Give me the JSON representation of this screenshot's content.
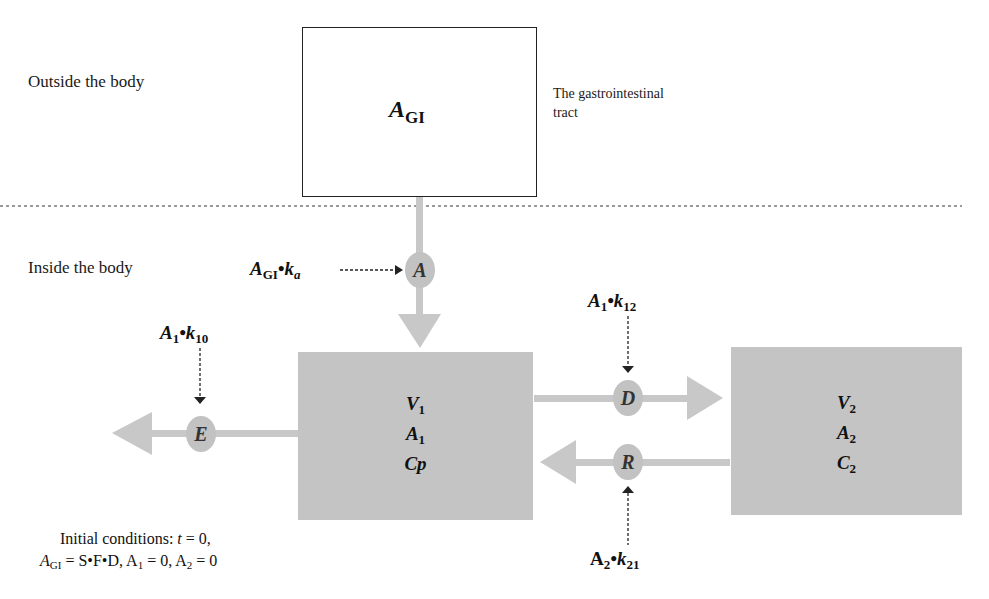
{
  "regions": {
    "outside_label": "Outside the body",
    "inside_label": "Inside the body"
  },
  "gi_compartment": {
    "symbol": "A",
    "symbol_sub": "GI",
    "description_line1": "The gastrointestinal",
    "description_line2": "tract"
  },
  "central_compartment": {
    "line1": "V",
    "line1_sub": "1",
    "line2": "A",
    "line2_sub": "1",
    "line3": "Cp"
  },
  "peripheral_compartment": {
    "line1": "V",
    "line1_sub": "2",
    "line2": "A",
    "line2_sub": "2",
    "line3": "C",
    "line3_sub": "2"
  },
  "processes": {
    "absorption": {
      "node": "A",
      "rate_main": "A",
      "rate_sub1": "GI",
      "rate_mid": "•k",
      "rate_sub2": "a"
    },
    "elimination": {
      "node": "E",
      "rate_main": "A",
      "rate_sub1": "1",
      "rate_mid": "•k",
      "rate_sub2": "10"
    },
    "distribution": {
      "node": "D",
      "rate_main": "A",
      "rate_sub1": "1",
      "rate_mid": "•k",
      "rate_sub2": "12"
    },
    "redistribution": {
      "node": "R",
      "rate_main": "A",
      "rate_sub1": "2",
      "rate_mid": "•k",
      "rate_sub2": "21"
    }
  },
  "initial_conditions": {
    "line1_prefix": "Initial conditions: ",
    "line1_t": "t",
    "line1_suffix": " = 0,",
    "line2_a": "A",
    "line2_a_sub": "GI",
    "line2_eq": " = S•F•D, A",
    "line2_a1_sub": "1",
    "line2_mid": " = 0, A",
    "line2_a2_sub": "2",
    "line2_end": " = 0"
  },
  "colors": {
    "compartment_gray": "#c4c4c4",
    "arrow_gray": "#c8c8c8",
    "node_gray": "#c2c2c2",
    "line_black": "#222222"
  }
}
